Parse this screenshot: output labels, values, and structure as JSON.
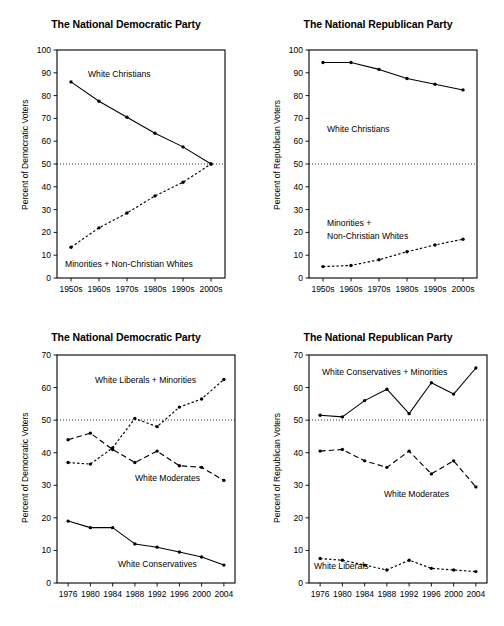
{
  "figure": {
    "background": "#ffffff",
    "ink": "#000000",
    "panel_count": 4
  },
  "panels": [
    {
      "id": "top-left",
      "title": "The National Democratic Party",
      "ylabel": "Percent of Democratic Voters",
      "yticks": [
        "0",
        "10",
        "20",
        "30",
        "40",
        "50",
        "60",
        "70",
        "80",
        "90",
        "100"
      ],
      "xticks": [
        "1950s",
        "1960s",
        "1970s",
        "1980s",
        "1990s",
        "2000s"
      ],
      "series_labels": [
        "White Christians",
        "Minorities + Non-Christian Whites"
      ]
    },
    {
      "id": "top-right",
      "title": "The National Republican Party",
      "ylabel": "Percent of Republican Voters",
      "yticks": [
        "0",
        "10",
        "20",
        "30",
        "40",
        "50",
        "60",
        "70",
        "80",
        "90",
        "100"
      ],
      "xticks": [
        "1950s",
        "1960s",
        "1970s",
        "1980s",
        "1990s",
        "2000s"
      ],
      "series_labels": [
        "White Christians",
        "Minorities +",
        "Non-Christian Whites"
      ]
    },
    {
      "id": "bottom-left",
      "title": "The National Democratic Party",
      "ylabel": "Percent of Democratic Voters",
      "yticks": [
        "0",
        "10",
        "20",
        "30",
        "40",
        "50",
        "60",
        "70"
      ],
      "xticks": [
        "1976",
        "1980",
        "1984",
        "1988",
        "1992",
        "1996",
        "2000",
        "2004"
      ],
      "series_labels": [
        "White Liberals + Minorities",
        "White Moderates",
        "White Conservatives"
      ]
    },
    {
      "id": "bottom-right",
      "title": "The National Republican Party",
      "ylabel": "Percent of Republican Voters",
      "yticks": [
        "0",
        "10",
        "20",
        "30",
        "40",
        "50",
        "60",
        "70"
      ],
      "xticks": [
        "1976",
        "1980",
        "1984",
        "1988",
        "1992",
        "1996",
        "2000",
        "2004"
      ],
      "series_labels": [
        "White Conservatives + Minorities",
        "White Moderates",
        "White Liberals"
      ]
    }
  ],
  "chart_data": [
    {
      "type": "line",
      "title": "The National Democratic Party",
      "xlabel": "",
      "ylabel": "Percent of Democratic Voters",
      "categories": [
        "1950s",
        "1960s",
        "1970s",
        "1980s",
        "1990s",
        "2000s"
      ],
      "ylim": [
        0,
        100
      ],
      "ytick_step": 10,
      "grid": false,
      "reference_line": 50,
      "legend": "inline-annotations",
      "series": [
        {
          "name": "White Christians",
          "style": "solid",
          "values": [
            86,
            77.5,
            70.5,
            63.5,
            57.5,
            50
          ]
        },
        {
          "name": "Minorities + Non-Christian Whites",
          "style": "dotted",
          "values": [
            13.5,
            22,
            28.5,
            36,
            42,
            50
          ]
        }
      ]
    },
    {
      "type": "line",
      "title": "The National Republican Party",
      "xlabel": "",
      "ylabel": "Percent of Republican Voters",
      "categories": [
        "1950s",
        "1960s",
        "1970s",
        "1980s",
        "1990s",
        "2000s"
      ],
      "ylim": [
        0,
        100
      ],
      "ytick_step": 10,
      "grid": false,
      "reference_line": 50,
      "legend": "inline-annotations",
      "series": [
        {
          "name": "White Christians",
          "style": "solid",
          "values": [
            94.5,
            94.5,
            91.5,
            87.5,
            85,
            82.5
          ]
        },
        {
          "name": "Minorities + Non-Christian Whites",
          "style": "dotted",
          "values": [
            5,
            5.5,
            8,
            11.5,
            14.5,
            17
          ]
        }
      ]
    },
    {
      "type": "line",
      "title": "The National Democratic Party",
      "xlabel": "",
      "ylabel": "Percent of Democratic Voters",
      "categories": [
        "1976",
        "1980",
        "1984",
        "1988",
        "1992",
        "1996",
        "2000",
        "2004"
      ],
      "ylim": [
        0,
        70
      ],
      "ytick_step": 10,
      "grid": false,
      "reference_line": 50,
      "legend": "inline-annotations",
      "series": [
        {
          "name": "White Liberals + Minorities",
          "style": "dotted",
          "values": [
            37,
            36.5,
            41.5,
            50.5,
            48,
            54,
            56.5,
            62.5
          ]
        },
        {
          "name": "White Moderates",
          "style": "dashed",
          "values": [
            44,
            46,
            41,
            37,
            40.5,
            36,
            35.5,
            31.5
          ]
        },
        {
          "name": "White Conservatives",
          "style": "solid",
          "values": [
            19,
            17,
            17,
            12,
            11,
            9.5,
            8,
            5.5
          ]
        }
      ]
    },
    {
      "type": "line",
      "title": "The National Republican Party",
      "xlabel": "",
      "ylabel": "Percent of Republican Voters",
      "categories": [
        "1976",
        "1980",
        "1984",
        "1988",
        "1992",
        "1996",
        "2000",
        "2004"
      ],
      "ylim": [
        0,
        70
      ],
      "ytick_step": 10,
      "grid": false,
      "reference_line": 50,
      "legend": "inline-annotations",
      "series": [
        {
          "name": "White Conservatives + Minorities",
          "style": "solid",
          "values": [
            51.5,
            51,
            56,
            59.5,
            52,
            61.5,
            58,
            66
          ]
        },
        {
          "name": "White Moderates",
          "style": "dashed",
          "values": [
            40.5,
            41,
            37.5,
            35.5,
            40.5,
            33.5,
            37.5,
            29.5
          ]
        },
        {
          "name": "White Liberals",
          "style": "dotted",
          "values": [
            7.5,
            7,
            5.5,
            4,
            7,
            4.5,
            4,
            3.5
          ]
        }
      ]
    }
  ]
}
